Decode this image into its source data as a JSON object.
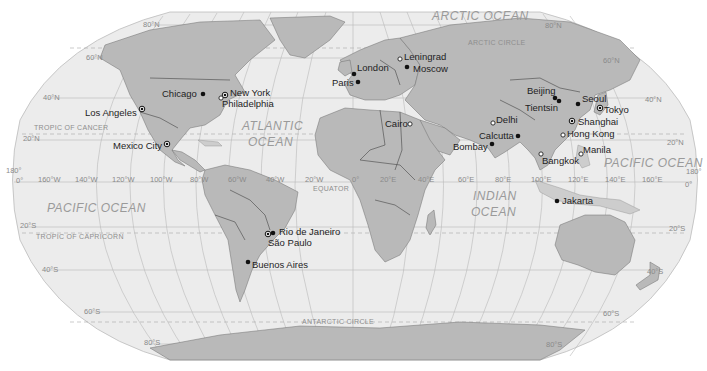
{
  "map": {
    "projection": "robinson-like",
    "colors": {
      "ocean": "#ececec",
      "land": "#b9b9b9",
      "grid": "#b8b8b8",
      "label_gray": "#8a8a8a",
      "city_text": "#1e1e1e"
    },
    "oceans": [
      {
        "id": "arctic",
        "label": "ARCTIC OCEAN",
        "x": 432,
        "y": 20
      },
      {
        "id": "atlantic-1",
        "label": "ATLANTIC",
        "x": 242,
        "y": 130
      },
      {
        "id": "atlantic-2",
        "label": "OCEAN",
        "x": 248,
        "y": 146
      },
      {
        "id": "pacific-east",
        "label": "PACIFIC OCEAN",
        "x": 47,
        "y": 212
      },
      {
        "id": "pacific-west",
        "label": "PACIFIC OCEAN",
        "x": 604,
        "y": 167
      },
      {
        "id": "indian-1",
        "label": "INDIAN",
        "x": 473,
        "y": 200
      },
      {
        "id": "indian-2",
        "label": "OCEAN",
        "x": 471,
        "y": 216
      }
    ],
    "special_lines": [
      {
        "id": "arctic-circle",
        "label": "ARCTIC CIRCLE",
        "x": 468,
        "y": 45
      },
      {
        "id": "tropic-cancer",
        "label": "TROPIC OF CANCER",
        "x": 34,
        "y": 130
      },
      {
        "id": "equator",
        "label": "EQUATOR",
        "x": 313,
        "y": 191
      },
      {
        "id": "tropic-capricorn",
        "label": "TROPIC OF CAPRICORN",
        "x": 36,
        "y": 239
      },
      {
        "id": "antarctic-circle",
        "label": "ANTARCTIC CIRCLE",
        "x": 302,
        "y": 324
      }
    ],
    "latitude_labels": [
      {
        "label": "80°N",
        "x": 143,
        "y": 27
      },
      {
        "label": "60°N",
        "x": 86,
        "y": 60
      },
      {
        "label": "40°N",
        "x": 43,
        "y": 100
      },
      {
        "label": "20°N",
        "x": 23,
        "y": 141
      },
      {
        "label": "0°",
        "x": 16,
        "y": 183
      },
      {
        "label": "20°S",
        "x": 20,
        "y": 228
      },
      {
        "label": "40°S",
        "x": 42,
        "y": 272
      },
      {
        "label": "60°S",
        "x": 84,
        "y": 314
      },
      {
        "label": "80°S",
        "x": 144,
        "y": 345
      },
      {
        "label": "80°N",
        "x": 545,
        "y": 28
      },
      {
        "label": "60°N",
        "x": 603,
        "y": 63
      },
      {
        "label": "40°N",
        "x": 645,
        "y": 102
      },
      {
        "label": "20°N",
        "x": 667,
        "y": 145
      },
      {
        "label": "0°",
        "x": 685,
        "y": 187
      },
      {
        "label": "20°S",
        "x": 669,
        "y": 231
      },
      {
        "label": "40°S",
        "x": 647,
        "y": 274
      },
      {
        "label": "60°S",
        "x": 603,
        "y": 316
      },
      {
        "label": "80°S",
        "x": 546,
        "y": 347
      }
    ],
    "longitude_labels": [
      {
        "label": "160°W",
        "x": 38,
        "y": 182
      },
      {
        "label": "140°W",
        "x": 75,
        "y": 182
      },
      {
        "label": "120°W",
        "x": 112,
        "y": 182
      },
      {
        "label": "100°W",
        "x": 150,
        "y": 182
      },
      {
        "label": "80°W",
        "x": 190,
        "y": 182
      },
      {
        "label": "60°W",
        "x": 228,
        "y": 182
      },
      {
        "label": "40°W",
        "x": 266,
        "y": 182
      },
      {
        "label": "20°W",
        "x": 305,
        "y": 182
      },
      {
        "label": "0°",
        "x": 352,
        "y": 182
      },
      {
        "label": "20°E",
        "x": 380,
        "y": 182
      },
      {
        "label": "40°E",
        "x": 418,
        "y": 182
      },
      {
        "label": "60°E",
        "x": 458,
        "y": 182
      },
      {
        "label": "80°E",
        "x": 495,
        "y": 182
      },
      {
        "label": "100°E",
        "x": 531,
        "y": 182
      },
      {
        "label": "120°E",
        "x": 568,
        "y": 182
      },
      {
        "label": "140°E",
        "x": 605,
        "y": 182
      },
      {
        "label": "160°E",
        "x": 642,
        "y": 182
      }
    ],
    "edge_labels": [
      {
        "label": "180°",
        "x": 6,
        "y": 173
      },
      {
        "label": "180°",
        "x": 686,
        "y": 174
      }
    ],
    "cities": [
      {
        "name": "Chicago",
        "x": 203,
        "y": 94,
        "marker": "filled",
        "lx": 162,
        "ly": 97,
        "anchor": "start"
      },
      {
        "name": "New York",
        "x": 225,
        "y": 95,
        "marker": "ring",
        "lx": 230,
        "ly": 96,
        "anchor": "start"
      },
      {
        "name": "Philadelphia",
        "x": 221,
        "y": 98,
        "marker": "open",
        "lx": 222,
        "ly": 107,
        "anchor": "start"
      },
      {
        "name": "Los Angeles",
        "x": 142,
        "y": 109,
        "marker": "ring",
        "lx": 85,
        "ly": 116,
        "anchor": "start"
      },
      {
        "name": "Mexico City",
        "x": 167,
        "y": 144,
        "marker": "ring",
        "lx": 113,
        "ly": 149,
        "anchor": "start"
      },
      {
        "name": "London",
        "x": 354,
        "y": 74,
        "marker": "filled",
        "lx": 357,
        "ly": 71,
        "anchor": "start"
      },
      {
        "name": "Paris",
        "x": 358,
        "y": 82,
        "marker": "filled",
        "lx": 332,
        "ly": 86,
        "anchor": "start"
      },
      {
        "name": "Leningrad",
        "x": 400,
        "y": 59,
        "marker": "open",
        "lx": 404,
        "ly": 60,
        "anchor": "start"
      },
      {
        "name": "Moscow",
        "x": 407,
        "y": 67,
        "marker": "filled",
        "lx": 413,
        "ly": 72,
        "anchor": "start"
      },
      {
        "name": "Cairo",
        "x": 410,
        "y": 124,
        "marker": "open",
        "lx": 385,
        "ly": 127,
        "anchor": "start"
      },
      {
        "name": "Delhi",
        "x": 493,
        "y": 123,
        "marker": "open",
        "lx": 496,
        "ly": 123,
        "anchor": "start"
      },
      {
        "name": "Calcutta",
        "x": 518,
        "y": 136,
        "marker": "filled",
        "lx": 479,
        "ly": 139,
        "anchor": "start"
      },
      {
        "name": "Bombay",
        "x": 492,
        "y": 144,
        "marker": "filled",
        "lx": 453,
        "ly": 150,
        "anchor": "start"
      },
      {
        "name": "Bangkok",
        "x": 541,
        "y": 154,
        "marker": "open",
        "lx": 542,
        "ly": 164,
        "anchor": "start"
      },
      {
        "name": "Beijing",
        "x": 555,
        "y": 98,
        "marker": "filled",
        "lx": 527,
        "ly": 94,
        "anchor": "start"
      },
      {
        "name": "Tientsin",
        "x": 559,
        "y": 101,
        "marker": "filled",
        "lx": 525,
        "ly": 111,
        "anchor": "start"
      },
      {
        "name": "Seoul",
        "x": 578,
        "y": 104,
        "marker": "filled",
        "lx": 582,
        "ly": 102,
        "anchor": "start"
      },
      {
        "name": "Tokyo",
        "x": 600,
        "y": 108,
        "marker": "ring",
        "lx": 604,
        "ly": 113,
        "anchor": "start"
      },
      {
        "name": "Shanghai",
        "x": 572,
        "y": 121,
        "marker": "ring",
        "lx": 578,
        "ly": 125,
        "anchor": "start"
      },
      {
        "name": "Hong Kong",
        "x": 563,
        "y": 135,
        "marker": "open",
        "lx": 567,
        "ly": 137,
        "anchor": "start"
      },
      {
        "name": "Manila",
        "x": 581,
        "y": 154,
        "marker": "open",
        "lx": 583,
        "ly": 153,
        "anchor": "start"
      },
      {
        "name": "Jakarta",
        "x": 557,
        "y": 201,
        "marker": "filled",
        "lx": 562,
        "ly": 204,
        "anchor": "start"
      },
      {
        "name": "Rio de Janeiro",
        "x": 273,
        "y": 233,
        "marker": "filled",
        "lx": 279,
        "ly": 235,
        "anchor": "start"
      },
      {
        "name": "São Paulo",
        "x": 268,
        "y": 234,
        "marker": "ring",
        "lx": 268,
        "ly": 246,
        "anchor": "start"
      },
      {
        "name": "Buenos Aires",
        "x": 248,
        "y": 262,
        "marker": "filled",
        "lx": 252,
        "ly": 268,
        "anchor": "start"
      }
    ]
  }
}
